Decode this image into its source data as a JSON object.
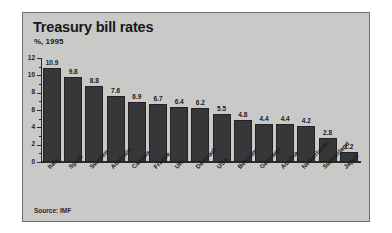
{
  "chart": {
    "title": "Treasury bill rates",
    "subtitle": "%, 1995",
    "source": "Source: IMF"
  },
  "chart_data": {
    "type": "bar",
    "title": "Treasury bill rates",
    "subtitle": "%, 1995",
    "xlabel": "",
    "ylabel": "%",
    "ylim": [
      0,
      12
    ],
    "yticks": [
      0,
      2,
      4,
      6,
      8,
      10,
      12
    ],
    "ytick_labels": [
      "0",
      "2",
      "4",
      "6",
      "8",
      "10",
      "12"
    ],
    "grid": false,
    "legend": false,
    "source": "Source: IMF",
    "bar_color": "#37373a",
    "background_color": "#c9c9c7",
    "categories": [
      "Italy",
      "Spain",
      "Sweden",
      "Australia",
      "Canada",
      "France",
      "UK",
      "Denmark",
      "USA",
      "Belgium",
      "Germany",
      "Austria",
      "Netherlands",
      "Switzerland",
      "Japan"
    ],
    "values": [
      10.9,
      9.8,
      8.8,
      7.6,
      6.9,
      6.7,
      6.4,
      6.2,
      5.5,
      4.8,
      4.4,
      4.4,
      4.2,
      2.8,
      1.2
    ],
    "value_labels": [
      "10.9",
      "9.8",
      "8.8",
      "7.6",
      "6.9",
      "6.7",
      "6.4",
      "6.2",
      "5.5",
      "4.8",
      "4.4",
      "4.4",
      "4.2",
      "2.8",
      "1.2"
    ]
  }
}
